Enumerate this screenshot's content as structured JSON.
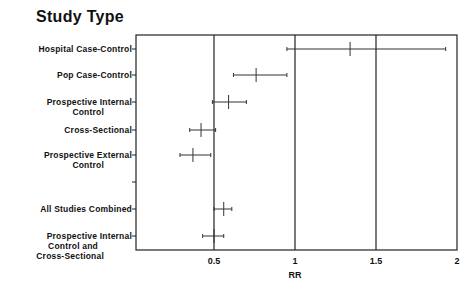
{
  "chart_data": {
    "type": "forest",
    "title": "Study Type",
    "xlabel": "RR",
    "ylabel": "",
    "xlim": [
      0,
      2
    ],
    "xticks": [
      0.5,
      1,
      1.5,
      2
    ],
    "xtick_labels": [
      "0.5",
      "1",
      "1.5",
      "2"
    ],
    "reference_lines": [
      0.5,
      1,
      1.5
    ],
    "grid": false,
    "categories": [
      "Hospital Case-Control",
      "Pop Case-Control",
      "Prospective Internal Control",
      "Cross-Sectional",
      "Prospective External Control",
      "",
      "All Studies Combined",
      "Prospective Internal Control and Cross-Sectional"
    ],
    "series": [
      {
        "name": "RR",
        "values": [
          1.34,
          0.76,
          0.59,
          0.42,
          0.37,
          null,
          0.56,
          0.5
        ]
      },
      {
        "name": "CI lower",
        "values": [
          0.95,
          0.62,
          0.49,
          0.35,
          0.29,
          null,
          0.5,
          0.43
        ]
      },
      {
        "name": "CI upper",
        "values": [
          1.93,
          0.95,
          0.7,
          0.51,
          0.48,
          null,
          0.61,
          0.56
        ]
      }
    ]
  },
  "labels": {
    "title": "Study Type",
    "xlabel": "RR",
    "rows": [
      [
        "Hospital Case-Control"
      ],
      [
        "Pop Case-Control"
      ],
      [
        "Prospective Internal",
        "Control"
      ],
      [
        "Cross-Sectional"
      ],
      [
        "Prospective External",
        "Control"
      ],
      [],
      [
        "All Studies Combined"
      ],
      [
        "Prospective Internal",
        "Control and",
        "Cross-Sectional"
      ]
    ]
  }
}
